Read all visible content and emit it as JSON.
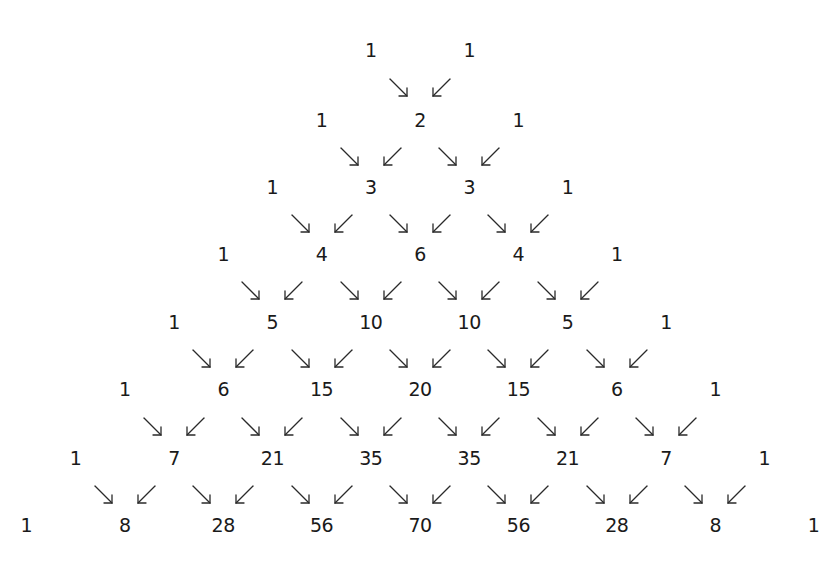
{
  "diagram": {
    "title": "",
    "type": "pascal-triangle",
    "text_color": "#1a1a1a",
    "background": "#ffffff",
    "rows": [
      [
        1,
        1
      ],
      [
        1,
        2,
        1
      ],
      [
        1,
        3,
        3,
        1
      ],
      [
        1,
        4,
        6,
        4,
        1
      ],
      [
        1,
        5,
        10,
        10,
        5,
        1
      ],
      [
        1,
        6,
        15,
        20,
        15,
        6,
        1
      ],
      [
        1,
        7,
        21,
        35,
        35,
        21,
        7,
        1
      ],
      [
        1,
        8,
        28,
        56,
        70,
        56,
        28,
        8,
        1
      ]
    ],
    "arrow_glyphs": {
      "from_left": "down-right-arrow",
      "from_right": "down-left-arrow"
    }
  },
  "layout": {
    "center_x": 420,
    "half_step_x": 49.2,
    "row_y": [
      50,
      120,
      187,
      254,
      322,
      389,
      458,
      525
    ],
    "arrow_offset_x": 21
  }
}
